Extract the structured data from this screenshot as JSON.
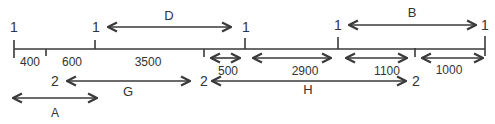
{
  "diagram": {
    "line_color": "#3a3a3a",
    "text_color": "#333333",
    "node_labels_top": [
      {
        "text": "1",
        "x": 14
      },
      {
        "text": "1",
        "x": 95
      },
      {
        "text": "1",
        "x": 245
      },
      {
        "text": "1",
        "x": 338
      },
      {
        "text": "1",
        "x": 485
      }
    ],
    "segments": [
      {
        "label": "400"
      },
      {
        "label": "600"
      },
      {
        "label": "3500"
      },
      {
        "label": "500"
      },
      {
        "label": "2900"
      },
      {
        "label": "1100"
      },
      {
        "label": "1000"
      }
    ],
    "spans": {
      "D": {
        "label": "D",
        "from_node": "1",
        "to_node": "1"
      },
      "B": {
        "label": "B",
        "from_node": "1",
        "to_node": "1"
      },
      "G": {
        "label": "G",
        "from_node": "2",
        "to_node": "2"
      },
      "H": {
        "label": "H",
        "from_node": "2",
        "to_node": "2"
      },
      "A": {
        "label": "A"
      }
    },
    "node_labels_bottom": [
      {
        "text": "2"
      },
      {
        "text": "2"
      },
      {
        "text": "2"
      }
    ]
  }
}
